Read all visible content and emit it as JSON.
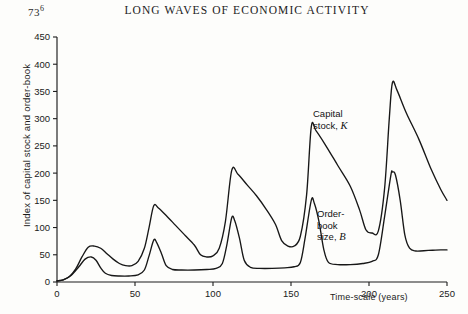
{
  "page": {
    "folio": "736",
    "folio_sup": "6",
    "running_head": "LONG WAVES OF ECONOMIC ACTIVITY"
  },
  "annotations": {
    "capital_stock": {
      "line1": "Capital",
      "line2": "stock,",
      "symbol": "K"
    },
    "order_book": {
      "line1": "Order-",
      "line2": "book",
      "line3": "size,",
      "symbol": "B"
    }
  },
  "chart_data": {
    "type": "line",
    "title": "LONG WAVES OF ECONOMIC ACTIVITY",
    "xlabel": "Time-scale (years)",
    "ylabel": "Index of capital stock and order-book",
    "xlim": [
      0,
      250
    ],
    "ylim": [
      0,
      450
    ],
    "xticks": [
      0,
      50,
      100,
      150,
      200,
      250
    ],
    "yticks": [
      0,
      50,
      100,
      150,
      200,
      250,
      300,
      350,
      400,
      450
    ],
    "grid": false,
    "legend": "annotated-inline",
    "series": [
      {
        "name": "Capital stock, K",
        "symbol": "K",
        "peaks": [
          {
            "x": 20,
            "y": 64
          },
          {
            "x": 62,
            "y": 140
          },
          {
            "x": 112,
            "y": 205
          },
          {
            "x": 163,
            "y": 285
          },
          {
            "x": 215,
            "y": 366
          }
        ],
        "troughs": [
          {
            "x": 0,
            "y": 2
          },
          {
            "x": 42,
            "y": 30
          },
          {
            "x": 92,
            "y": 44
          },
          {
            "x": 143,
            "y": 62
          },
          {
            "x": 196,
            "y": 82
          },
          {
            "x": 250,
            "y": 150
          }
        ],
        "points": [
          [
            0,
            2
          ],
          [
            4,
            4
          ],
          [
            8,
            10
          ],
          [
            12,
            24
          ],
          [
            16,
            46
          ],
          [
            20,
            64
          ],
          [
            24,
            66
          ],
          [
            28,
            62
          ],
          [
            32,
            52
          ],
          [
            36,
            42
          ],
          [
            40,
            34
          ],
          [
            44,
            30
          ],
          [
            48,
            30
          ],
          [
            52,
            38
          ],
          [
            56,
            62
          ],
          [
            59,
            100
          ],
          [
            62,
            140
          ],
          [
            65,
            136
          ],
          [
            70,
            122
          ],
          [
            76,
            104
          ],
          [
            82,
            86
          ],
          [
            88,
            68
          ],
          [
            92,
            50
          ],
          [
            96,
            46
          ],
          [
            100,
            48
          ],
          [
            104,
            62
          ],
          [
            108,
            112
          ],
          [
            112,
            205
          ],
          [
            116,
            198
          ],
          [
            122,
            178
          ],
          [
            128,
            158
          ],
          [
            134,
            134
          ],
          [
            140,
            106
          ],
          [
            144,
            76
          ],
          [
            148,
            66
          ],
          [
            152,
            66
          ],
          [
            156,
            84
          ],
          [
            160,
            160
          ],
          [
            163,
            285
          ],
          [
            166,
            278
          ],
          [
            172,
            252
          ],
          [
            180,
            214
          ],
          [
            188,
            176
          ],
          [
            194,
            132
          ],
          [
            198,
            96
          ],
          [
            202,
            90
          ],
          [
            206,
            94
          ],
          [
            210,
            172
          ],
          [
            213,
            300
          ],
          [
            215,
            366
          ],
          [
            218,
            352
          ],
          [
            224,
            310
          ],
          [
            232,
            262
          ],
          [
            240,
            206
          ],
          [
            246,
            170
          ],
          [
            250,
            150
          ]
        ]
      },
      {
        "name": "Order-book size, B",
        "symbol": "B",
        "peaks": [
          {
            "x": 22,
            "y": 46
          },
          {
            "x": 62,
            "y": 77
          },
          {
            "x": 112,
            "y": 118
          },
          {
            "x": 163,
            "y": 150
          },
          {
            "x": 215,
            "y": 202
          }
        ],
        "baselines": [
          {
            "from": 30,
            "to": 55,
            "y": 12
          },
          {
            "from": 70,
            "to": 100,
            "y": 22
          },
          {
            "from": 120,
            "to": 150,
            "y": 25
          },
          {
            "from": 172,
            "to": 200,
            "y": 32
          },
          {
            "from": 226,
            "to": 250,
            "y": 59
          }
        ],
        "points": [
          [
            0,
            2
          ],
          [
            4,
            4
          ],
          [
            9,
            12
          ],
          [
            14,
            28
          ],
          [
            18,
            42
          ],
          [
            22,
            46
          ],
          [
            25,
            40
          ],
          [
            28,
            26
          ],
          [
            31,
            16
          ],
          [
            35,
            12
          ],
          [
            40,
            11
          ],
          [
            46,
            11
          ],
          [
            52,
            13
          ],
          [
            56,
            22
          ],
          [
            59,
            48
          ],
          [
            62,
            77
          ],
          [
            64,
            72
          ],
          [
            67,
            52
          ],
          [
            70,
            30
          ],
          [
            74,
            23
          ],
          [
            80,
            22
          ],
          [
            88,
            22
          ],
          [
            96,
            23
          ],
          [
            102,
            25
          ],
          [
            106,
            34
          ],
          [
            109,
            70
          ],
          [
            112,
            118
          ],
          [
            114,
            112
          ],
          [
            117,
            80
          ],
          [
            120,
            40
          ],
          [
            124,
            27
          ],
          [
            130,
            25
          ],
          [
            138,
            25
          ],
          [
            146,
            26
          ],
          [
            152,
            28
          ],
          [
            156,
            36
          ],
          [
            159,
            80
          ],
          [
            163,
            150
          ],
          [
            165,
            144
          ],
          [
            168,
            110
          ],
          [
            171,
            60
          ],
          [
            174,
            36
          ],
          [
            180,
            32
          ],
          [
            188,
            32
          ],
          [
            196,
            34
          ],
          [
            202,
            38
          ],
          [
            206,
            50
          ],
          [
            210,
            120
          ],
          [
            214,
            196
          ],
          [
            215,
            202
          ],
          [
            217,
            196
          ],
          [
            220,
            150
          ],
          [
            223,
            86
          ],
          [
            226,
            62
          ],
          [
            230,
            57
          ],
          [
            238,
            58
          ],
          [
            246,
            59
          ],
          [
            250,
            59
          ]
        ]
      }
    ]
  }
}
